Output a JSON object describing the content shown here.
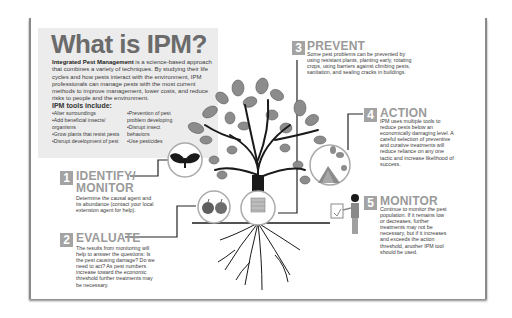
{
  "header": {
    "title": "What is IPM?",
    "intro_bold": "Integrated Pest Management",
    "intro_rest": " is a science-based approach that combines a variety of techniques. By studying their life cycles and how pests interact with the environment, IPM professionals can manage pests with the most current methods to improve management, lower costs, and reduce risks to people and the environment."
  },
  "tools": {
    "heading": "IPM tools include:",
    "left": [
      "Alter surroundings",
      "Add beneficial insects/ organisms",
      "Grow plants that resist pests",
      "Disrupt development of pest"
    ],
    "right": [
      "Prevention of pest problem developing",
      "Disrupt insect behaviors",
      "Use pesticides"
    ]
  },
  "steps": [
    {
      "number": "1",
      "title": "IDENTIFY/",
      "title2": "MONITOR",
      "text": "Determine the causal agent and its abundance (contact your local extension agent for help)."
    },
    {
      "number": "2",
      "title": "EVALUATE",
      "text": "The results from monitoring will help to answer the questions: Is the pest causing damage? Do we need to act? As pest numbers increase toward the economic threshold further treatments may be necessary."
    },
    {
      "number": "3",
      "title": "PREVENT",
      "text": "Some pest problems can be prevented by using resistant plants, planting early, rotating crops, using barriers against climbing pests, sanitation, and sealing cracks in buildings."
    },
    {
      "number": "4",
      "title": "ACTION",
      "text": "IPM uses multiple tools to reduce pests below an economically damaging level. A careful selection of preventive and curative treatments will reduce reliance on any one tactic and increase likelihood of success."
    },
    {
      "number": "5",
      "title": "MONITOR",
      "text": "Continue to monitor the pest population. If it remains low or decreases, further treatments may not be necessary, but if it increases and exceeds the action threshold, another IPM tool should be used."
    }
  ],
  "colors": {
    "title_gray": "#6b6b6b",
    "number_box": "#a3a3a3",
    "step_title": "#9a9a9a",
    "intro_bg": "#ececec",
    "leaf": "#8c8c8c",
    "trunk": "#1a1a1a"
  },
  "icons": [
    "moth-icon",
    "apples-icon",
    "tree-band-icon",
    "garden-tent-icon",
    "person-clipboard-icon"
  ]
}
